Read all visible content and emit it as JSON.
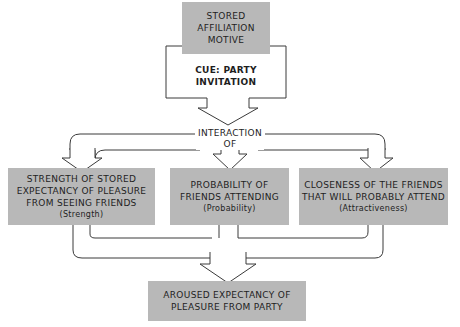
{
  "diagram": {
    "top_box": {
      "lines": [
        "STORED",
        "AFFILIATION",
        "MOTIVE"
      ]
    },
    "cue": {
      "lines": [
        "CUE:  PARTY",
        "INVITATION"
      ]
    },
    "interaction": {
      "lines": [
        "INTERACTION",
        "OF"
      ]
    },
    "factors": [
      {
        "lines": [
          "STRENGTH OF STORED",
          "EXPECTANCY OF PLEASURE",
          "FROM SEEING FRIENDS"
        ],
        "tag": "(Strength)"
      },
      {
        "lines": [
          "PROBABILITY OF",
          "FRIENDS ATTENDING"
        ],
        "tag": "(Probability)"
      },
      {
        "lines": [
          "CLOSENESS OF THE FRIENDS",
          "THAT WILL PROBABLY ATTEND"
        ],
        "tag": "(Attractiveness)"
      }
    ],
    "result_box": {
      "lines": [
        "AROUSED EXPECTANCY OF",
        "PLEASURE FROM PARTY"
      ]
    },
    "colors": {
      "box_fill": "#b8b8b8",
      "line": "#3a3a3a",
      "background": "#ffffff"
    }
  }
}
